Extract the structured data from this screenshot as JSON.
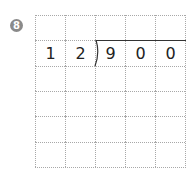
{
  "problem": {
    "number": "8",
    "divisor": [
      "1",
      "2"
    ],
    "dividend": [
      "9",
      "0",
      "0"
    ],
    "grid": {
      "columns": 5,
      "rows": 6
    },
    "colors": {
      "badge": "#8a8a8a",
      "grid_line": "#a8a8a8",
      "text": "#222222"
    }
  }
}
